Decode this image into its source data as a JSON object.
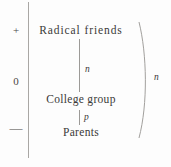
{
  "figure": {
    "background_color": "#fdfdfd",
    "ink_color": "#3b3a38",
    "rule_color": "#a9a7a4"
  },
  "axis": {
    "orientation": "vertical",
    "ticks": [
      {
        "label": "+",
        "position": "top"
      },
      {
        "label": "0",
        "position": "middle"
      },
      {
        "label": "—",
        "position": "bottom"
      }
    ]
  },
  "nodes": [
    {
      "label": "Radical friends",
      "level": "+"
    },
    {
      "label": "College group",
      "level": "0"
    },
    {
      "label": "Parents",
      "level": "—"
    }
  ],
  "edges": [
    {
      "label": "n",
      "from": "Radical friends",
      "to": "College group"
    },
    {
      "label": "p",
      "from": "College group",
      "to": "Parents"
    }
  ],
  "brace": {
    "label": "n",
    "shape": "arc",
    "side": "right"
  }
}
